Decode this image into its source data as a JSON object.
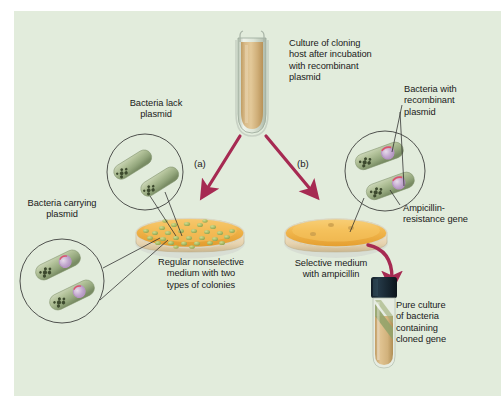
{
  "figure": {
    "panel_background": "#e2ecdc",
    "outer_background": "#ffffff"
  },
  "colors": {
    "panel": "#e2ecdc",
    "arrow": "#a62a52",
    "agar_nonselective": "#efa93c",
    "agar_selective": "#f0ae3f",
    "dish_rim": "#cfd3cd",
    "bacteria_body": "#9fb08a",
    "bacteria_chromosome": "#3d4a2e",
    "plasmid_ring": "#c4a7cf",
    "amp_gene": "#d9566a",
    "culture_liquid": "#d4b47e",
    "tube_glass": "#dfe6da",
    "tube_cap": "#1b2a35",
    "colony_green": "#aebf6e",
    "text": "#1a1a1a",
    "leader_line": "#2a2a2a"
  },
  "labels": {
    "culture_host": "Culture of cloning\nhost after incubation\nwith recombinant\nplasmid",
    "bacteria_lack_plasmid": "Bacteria lack\nplasmid",
    "bacteria_with_recombinant": "Bacteria with\nrecombinant\nplasmid",
    "bacteria_carrying_plasmid": "Bacteria carrying\nplasmid",
    "ampicillin_resistance_gene": "Ampicillin-\nresistance gene",
    "nonselective_medium": "Regular nonselective\nmedium with two\ntypes of colonies",
    "selective_medium": "Selective medium\nwith ampicillin",
    "pure_culture": "Pure culture\nof bacteria\ncontaining\ncloned gene",
    "step_a": "(a)",
    "step_b": "(b)"
  },
  "elements": {
    "source_tube": {
      "name": "culture-tube",
      "liquid_color": "#d4b47e",
      "glass_color": "#dfe6da"
    },
    "left_dish": {
      "name": "nonselective-petri-dish",
      "agar_color": "#efa93c",
      "colony_count": 30,
      "colony_color": "#aebf6e",
      "medium_type": "nonselective"
    },
    "right_dish": {
      "name": "selective-petri-dish",
      "agar_color": "#f0ae3f",
      "colony_count": 3,
      "colony_color": "#c9a24a",
      "medium_type": "selective with ampicillin"
    },
    "result_tube": {
      "name": "pure-culture-tube",
      "cap_color": "#1b2a35",
      "liquid_color": "#d4b47e",
      "streak_color": "#8d9b63"
    },
    "inset_lack_plasmid": {
      "name": "inset-bacteria-lack-plasmid",
      "bacteria_count": 2,
      "has_plasmid": false
    },
    "inset_carrying_plasmid": {
      "name": "inset-bacteria-carrying-plasmid",
      "bacteria_count": 2,
      "has_plasmid": true
    },
    "inset_recombinant": {
      "name": "inset-bacteria-recombinant-plasmid",
      "bacteria_count": 2,
      "has_plasmid": true,
      "has_amp_gene": true
    }
  },
  "arrows": [
    {
      "name": "arrow-to-nonselective",
      "label": "(a)",
      "from": "culture-tube",
      "to": "nonselective-petri-dish"
    },
    {
      "name": "arrow-to-selective",
      "label": "(b)",
      "from": "culture-tube",
      "to": "selective-petri-dish"
    },
    {
      "name": "arrow-to-pure-culture",
      "label": "",
      "from": "selective-petri-dish",
      "to": "pure-culture-tube"
    }
  ]
}
